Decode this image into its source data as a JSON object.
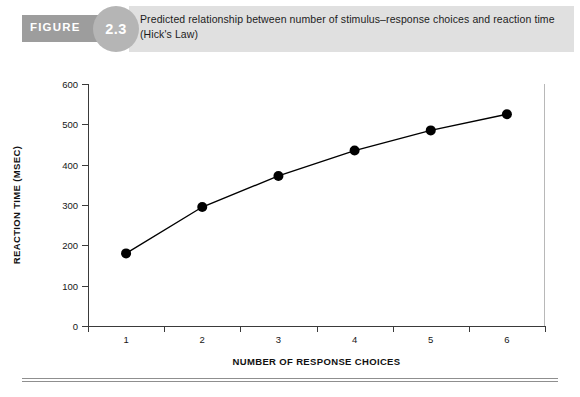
{
  "figure": {
    "label": "FIGURE",
    "number": "2.3",
    "caption": "Predicted relationship between number of stimulus–response choices and reaction time (Hick's Law)"
  },
  "chart_data": {
    "type": "line",
    "title": "Predicted relationship between number of stimulus–response choices and reaction time (Hick's Law)",
    "xlabel": "NUMBER OF RESPONSE CHOICES",
    "ylabel": "REACTION TIME (MSEC)",
    "categories": [
      "1",
      "2",
      "3",
      "4",
      "5",
      "6"
    ],
    "x": [
      1,
      2,
      3,
      4,
      5,
      6
    ],
    "values": [
      180,
      295,
      372,
      435,
      485,
      525
    ],
    "xlim": [
      0.5,
      6.5
    ],
    "ylim": [
      0,
      600
    ],
    "ytick_labels": [
      "0",
      "100",
      "200",
      "300",
      "400",
      "500",
      "600"
    ],
    "ytick_values": [
      0,
      100,
      200,
      300,
      400,
      500,
      600
    ],
    "xtick_labels": [
      "1",
      "2",
      "3",
      "4",
      "5",
      "6"
    ],
    "grid": false,
    "legend": false,
    "legend_position": "none",
    "series": [
      {
        "name": "Reaction time",
        "values": [
          180,
          295,
          372,
          435,
          485,
          525
        ],
        "marker": "circle",
        "color": "#000000",
        "line_color": "#000000"
      }
    ],
    "colors": {
      "line": "#000000",
      "marker": "#000000",
      "axis": "#3a3a3a",
      "text": "#111111"
    }
  },
  "styling": {
    "header_band_color": "#e0e0e0",
    "figure_bar_color": "#9d9d9d",
    "figure_circle_color": "#b5b5b5",
    "rule_color": "#8f8f8f"
  }
}
